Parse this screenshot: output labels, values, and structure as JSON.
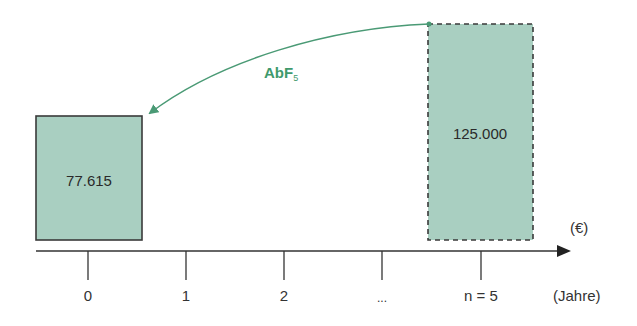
{
  "diagram": {
    "type": "timeline-discounting",
    "colors": {
      "box_fill": "#a9cfc1",
      "box_stroke": "#3a3a3a",
      "arrow": "#4a9a75",
      "axis": "#333333"
    },
    "present_value_box": {
      "label": "77.615",
      "period": "0",
      "border": "solid"
    },
    "future_value_box": {
      "label": "125.000",
      "period": "n = 5",
      "border": "dashed"
    },
    "arrow_label": {
      "main": "AbF",
      "subscript": "5"
    },
    "axis": {
      "value_unit": "(€)",
      "time_unit": "(Jahre)",
      "ticks": [
        "0",
        "1",
        "2",
        "...",
        "n = 5"
      ]
    }
  }
}
